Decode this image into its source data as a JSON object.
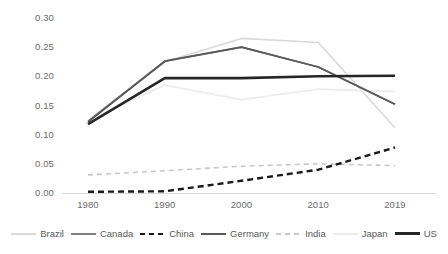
{
  "chart_data": {
    "type": "line",
    "title": "",
    "subtitle": "",
    "xlabel": "",
    "ylabel": "",
    "x": [
      "1980",
      "1990",
      "2000",
      "2010",
      "2019"
    ],
    "categories": [
      "1980",
      "1990",
      "2000",
      "2010",
      "2019"
    ],
    "xticklabels": [
      "1980",
      "1990",
      "2000",
      "2010",
      "2019"
    ],
    "yticklabels": [
      "0.30",
      "0.25",
      "0.20",
      "0.15",
      "0.10",
      "0.05",
      "0.00"
    ],
    "ytickvalues": [
      0.3,
      0.25,
      0.2,
      0.15,
      0.1,
      0.05,
      0.0
    ],
    "ylim": [
      0.0,
      0.3
    ],
    "grid": "horizontal-baseline-only",
    "legend_position": "bottom",
    "series": [
      {
        "name": "Brazil",
        "values": [
          0.125,
          0.225,
          0.265,
          0.258,
          0.112
        ],
        "color": "#d9d9d9",
        "style": "solid",
        "width": 1.6
      },
      {
        "name": "Canada",
        "values": [
          0.122,
          0.226,
          0.25,
          0.216,
          0.152
        ],
        "color": "#7f7f7f",
        "style": "solid",
        "width": 1.8
      },
      {
        "name": "China",
        "values": [
          0.002,
          0.003,
          0.021,
          0.04,
          0.078
        ],
        "color": "#1a1a1a",
        "style": "dashed",
        "width": 2.4
      },
      {
        "name": "Germany",
        "values": [
          0.122,
          0.226,
          0.25,
          0.216,
          0.152
        ],
        "color": "#595959",
        "style": "solid",
        "width": 1.8
      },
      {
        "name": "India",
        "values": [
          0.031,
          0.038,
          0.046,
          0.05,
          0.047
        ],
        "color": "#c8c8c8",
        "style": "dashed",
        "width": 1.6
      },
      {
        "name": "Japan",
        "values": [
          0.125,
          0.185,
          0.16,
          0.178,
          0.174
        ],
        "color": "#ededed",
        "style": "solid",
        "width": 1.8
      },
      {
        "name": "US",
        "values": [
          0.118,
          0.197,
          0.197,
          0.2,
          0.201
        ],
        "color": "#262626",
        "style": "solid",
        "width": 2.6
      }
    ]
  },
  "legend": {
    "items": [
      {
        "label": "Brazil"
      },
      {
        "label": "Canada"
      },
      {
        "label": "China"
      },
      {
        "label": "Germany"
      },
      {
        "label": "India"
      },
      {
        "label": "Japan"
      },
      {
        "label": "US"
      }
    ]
  }
}
